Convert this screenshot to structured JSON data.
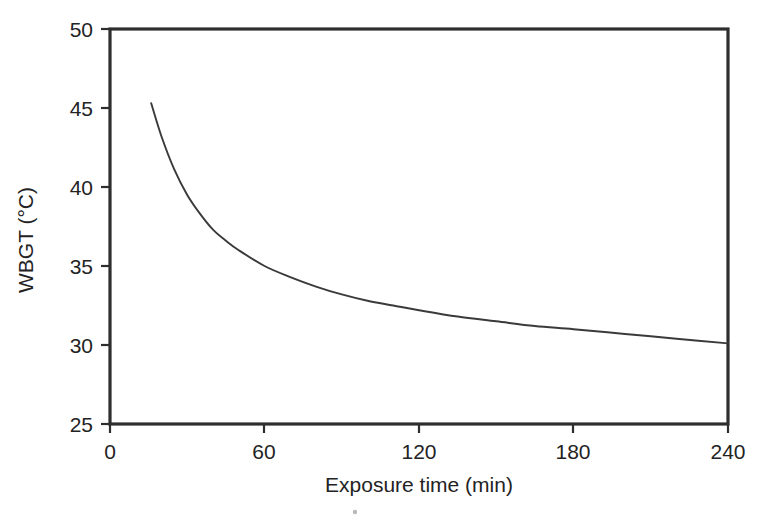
{
  "figure": {
    "background_color": "#ffffff",
    "frame_color": "#2e2e2e",
    "curve_color": "#3a3a3a",
    "text_color": "#232323"
  },
  "chart_data": {
    "type": "line",
    "title": "",
    "subtitle": "",
    "xlabel": "Exposure time (min)",
    "ylabel": "WBGT (°C)",
    "xlim": [
      0,
      240
    ],
    "ylim": [
      25,
      50
    ],
    "xticks": [
      0,
      60,
      120,
      180,
      240
    ],
    "xtick_labels": [
      "0",
      "60",
      "120",
      "180",
      "240"
    ],
    "yticks": [
      25,
      30,
      35,
      40,
      45,
      50
    ],
    "ytick_labels": [
      "25",
      "30",
      "35",
      "40",
      "45",
      "50"
    ],
    "grid": false,
    "legend": null,
    "legend_position": "none",
    "annotations": [],
    "series": [
      {
        "name": "WBGT threshold curve",
        "x": [
          16,
          20,
          25,
          30,
          35,
          40,
          45,
          50,
          60,
          70,
          80,
          90,
          100,
          110,
          120,
          135,
          150,
          165,
          180,
          200,
          220,
          240
        ],
        "y": [
          45.3,
          43.2,
          41.1,
          39.5,
          38.3,
          37.3,
          36.6,
          36.0,
          35.0,
          34.3,
          33.7,
          33.2,
          32.8,
          32.5,
          32.2,
          31.8,
          31.5,
          31.2,
          31.0,
          30.7,
          30.4,
          30.1
        ]
      }
    ]
  },
  "artifacts": {
    "speck_note": "scan speck"
  }
}
